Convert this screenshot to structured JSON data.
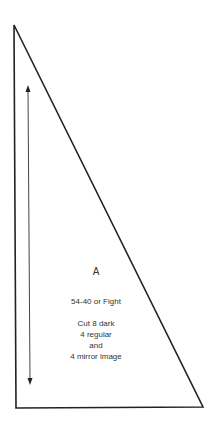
{
  "template_piece": {
    "letter": "A",
    "pattern_name": "54-40 or Fight",
    "instructions": [
      "Cut 8 dark",
      "4 regular",
      "and",
      "4 mirror image"
    ]
  },
  "shape": {
    "type": "right-triangle",
    "stroke_color": "#222222",
    "points": [
      [
        14,
        25
      ],
      [
        16,
        408
      ],
      [
        203,
        407
      ]
    ]
  },
  "grain_arrow": {
    "direction": "vertical-double-headed",
    "from": [
      28,
      86
    ],
    "to": [
      30,
      384
    ],
    "color": "#444444"
  }
}
